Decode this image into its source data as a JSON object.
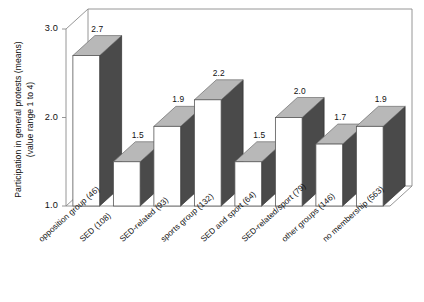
{
  "chart_data": {
    "type": "bar",
    "title": "",
    "subtitle": "",
    "xlabel": "",
    "ylabel": "Participation in general protests (means) (value range 1 to 4)",
    "ylabel_lines": [
      "Participation in general protests (means)",
      "(value range 1 to 4)"
    ],
    "categories": [
      "opposition group (46)",
      "SED (108)",
      "SED-related (93)",
      "sports group (132)",
      "SED and sport (64)",
      "SED-related/sport (79)",
      "other groups (146)",
      "no membership (563)"
    ],
    "values": [
      2.7,
      1.5,
      1.9,
      2.2,
      1.5,
      2.0,
      1.7,
      1.9
    ],
    "value_labels": [
      "2.7",
      "1.5",
      "1.9",
      "2.2",
      "1.5",
      "2.0",
      "1.7",
      "1.9"
    ],
    "group_counts": [
      46,
      108,
      93,
      132,
      64,
      79,
      146,
      563
    ],
    "ylim": [
      1.0,
      3.0
    ],
    "yticks": [
      1.0,
      2.0,
      3.0
    ],
    "ytick_labels": [
      "1.0",
      "2.0",
      "3.0"
    ],
    "grid": false,
    "legend": "none",
    "style": "3d-bar",
    "colors": {
      "bar_front": "#ffffff",
      "bar_top": "#b8b8b8",
      "bar_side": "#4a4a4a",
      "axis_line": "#8a8a8a",
      "floor": "#ffffff",
      "text": "#111111",
      "background": "#ffffff"
    }
  }
}
